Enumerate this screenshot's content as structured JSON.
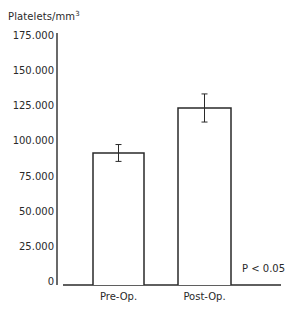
{
  "chart_data": {
    "type": "bar",
    "title": "",
    "xlabel": "",
    "ylabel": "Platelets/mm³",
    "categories": [
      "Pre-Op.",
      "Post-Op."
    ],
    "values": [
      92500,
      124500
    ],
    "error": [
      6000,
      10000
    ],
    "ylim": [
      0,
      175000
    ],
    "yticks": [
      0,
      25000,
      50000,
      75000,
      100000,
      125000,
      150000,
      175000
    ],
    "ytick_labels": [
      "0",
      "25.000",
      "50.000",
      "75.000",
      "100.000",
      "125.000",
      "150.000",
      "175.000"
    ],
    "grid": false,
    "legend": null,
    "annotations": [
      "P < 0.05"
    ],
    "bar_fill": "#ffffff",
    "bar_edge": "#2a2a2a"
  },
  "labels": {
    "ylabel_main": "Platelets/mm",
    "ylabel_sup": "3",
    "pvalue": "P < 0.05"
  }
}
